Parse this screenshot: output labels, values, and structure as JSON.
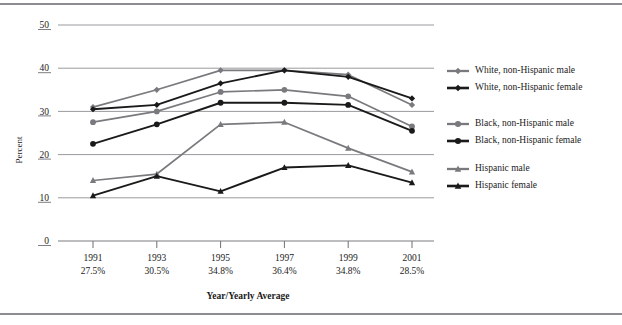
{
  "chart_data": {
    "type": "line",
    "title": "",
    "xlabel": "Year/Yearly Average",
    "ylabel": "Percent",
    "ylim": [
      0,
      50
    ],
    "yticks": [
      "0",
      "10",
      "20",
      "30",
      "40",
      "50"
    ],
    "grid": true,
    "legend_position": "right",
    "categories": [
      "1991",
      "1993",
      "1995",
      "1997",
      "1999",
      "2001"
    ],
    "category_sublabels": [
      "27.5%",
      "30.5%",
      "34.8%",
      "36.4%",
      "34.8%",
      "28.5%"
    ],
    "x": [
      1991,
      1993,
      1995,
      1997,
      1999,
      2001
    ],
    "series": [
      {
        "name": "White, non-Hispanic male",
        "marker": "diamond",
        "color": "#7a7a7e",
        "values": [
          31.0,
          35.0,
          39.5,
          39.5,
          38.5,
          31.5
        ]
      },
      {
        "name": "White, non-Hispanic female",
        "marker": "diamond",
        "color": "#1a1a1a",
        "values": [
          30.5,
          31.5,
          36.5,
          39.5,
          38.0,
          33.0
        ]
      },
      {
        "name": "Black, non-Hispanic male",
        "marker": "circle",
        "color": "#7a7a7e",
        "values": [
          27.5,
          30.0,
          34.5,
          35.0,
          33.5,
          26.5
        ]
      },
      {
        "name": "Black, non-Hispanic female",
        "marker": "circle",
        "color": "#1a1a1a",
        "values": [
          22.5,
          27.0,
          32.0,
          32.0,
          31.5,
          25.5
        ]
      },
      {
        "name": "Hispanic male",
        "marker": "triangle",
        "color": "#7a7a7e",
        "values": [
          14.0,
          15.5,
          27.0,
          27.5,
          21.5,
          16.0
        ]
      },
      {
        "name": "Hispanic female",
        "marker": "triangle",
        "color": "#1a1a1a",
        "values": [
          10.5,
          15.0,
          11.5,
          17.0,
          17.5,
          13.5
        ]
      }
    ]
  },
  "legend": {
    "entries": [
      {
        "label": "White, non-Hispanic male"
      },
      {
        "label": "White, non-Hispanic female"
      },
      {
        "label": "Black, non-Hispanic male"
      },
      {
        "label": "Black, non-Hispanic female"
      },
      {
        "label": "Hispanic male"
      },
      {
        "label": "Hispanic female"
      }
    ]
  },
  "axes": {
    "y_title": "Percent",
    "x_title": "Year/Yearly Average"
  },
  "colors": {
    "male_series": "#7a7a7e",
    "female_series": "#1a1a1a",
    "gridline": "#9a9a9e",
    "frame": "#8c8c92"
  }
}
